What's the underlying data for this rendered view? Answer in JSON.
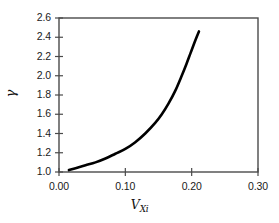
{
  "chart_data": {
    "type": "line",
    "title": "",
    "subtitle": "",
    "xlabel": "V_Xi",
    "xlabel_base": "V",
    "xlabel_sub": "Xi",
    "ylabel": "γ",
    "xlim": [
      0.0,
      0.3
    ],
    "ylim": [
      1.0,
      2.6
    ],
    "xticks": [
      0.0,
      0.1,
      0.2,
      0.3
    ],
    "xtick_labels": [
      "0.00",
      "0.10",
      "0.20",
      "0.30"
    ],
    "yticks": [
      1.0,
      1.2,
      1.4,
      1.6,
      1.8,
      2.0,
      2.2,
      2.4,
      2.6
    ],
    "ytick_labels": [
      "1.0",
      "1.2",
      "1.4",
      "1.6",
      "1.8",
      "2.0",
      "2.2",
      "2.4",
      "2.6"
    ],
    "grid": false,
    "legend": null,
    "frame": true,
    "series": [
      {
        "name": "gamma vs V_Xi",
        "color": "#000000",
        "line_width": 2.6,
        "x": [
          0.015,
          0.025,
          0.04,
          0.055,
          0.07,
          0.085,
          0.1,
          0.115,
          0.13,
          0.145,
          0.155,
          0.165,
          0.175,
          0.185,
          0.192,
          0.198,
          0.204,
          0.208,
          0.211
        ],
        "y": [
          1.02,
          1.04,
          1.07,
          1.1,
          1.14,
          1.19,
          1.24,
          1.31,
          1.4,
          1.51,
          1.6,
          1.71,
          1.84,
          2.0,
          2.12,
          2.23,
          2.34,
          2.41,
          2.46
        ]
      }
    ]
  },
  "axes": {
    "x_tick_pixels": [
      59,
      125.33,
      191.67,
      258
    ],
    "y_tick_pixels": [
      172,
      152.75,
      133.5,
      114.25,
      95,
      75.75,
      56.5,
      37.25,
      18
    ]
  }
}
